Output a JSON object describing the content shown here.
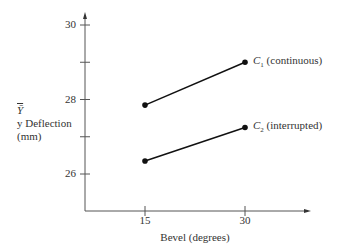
{
  "chart_data": {
    "type": "line",
    "title": "",
    "xlabel": "Bevel (degrees)",
    "ylabel": [
      "Ȳ",
      "y Deflection",
      "(mm)"
    ],
    "x": [
      15,
      30
    ],
    "x_ticks": [
      "15",
      "30"
    ],
    "y_ticks": [
      "26",
      "28",
      "30"
    ],
    "y_minor_ticks": [
      27,
      29
    ],
    "ylim": [
      25,
      30.3
    ],
    "grid": false,
    "series": [
      {
        "name": "C1 (continuous)",
        "symbol": "C",
        "subscript": "1",
        "desc": "(continuous)",
        "values": [
          27.85,
          29.0
        ]
      },
      {
        "name": "C2 (interrupted)",
        "symbol": "C",
        "subscript": "2",
        "desc": "(interrupted)",
        "values": [
          26.35,
          27.25
        ]
      }
    ],
    "legend_position": "inline-right"
  },
  "colors": {
    "line": "#111111",
    "axis": "#444444"
  }
}
